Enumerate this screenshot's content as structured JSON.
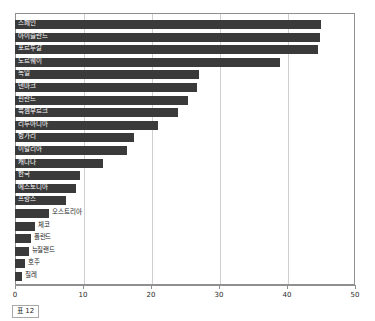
{
  "caption": "표 12",
  "chart_data": {
    "type": "bar",
    "orientation": "horizontal",
    "title": "",
    "xlabel": "",
    "ylabel": "",
    "xlim": [
      0,
      50
    ],
    "xticks": [
      0,
      10,
      20,
      30,
      40,
      50
    ],
    "grid": true,
    "legend": "none",
    "bar_color": "#3a3a3a",
    "categories": [
      "스페인",
      "아이슬란드",
      "포르투갈",
      "노르웨이",
      "독일",
      "덴마크",
      "핀란드",
      "룩셈부르크",
      "리투아니아",
      "헝가리",
      "이탈리아",
      "캐나다",
      "한국",
      "에스토니아",
      "프랑스",
      "오스트리아",
      "체코",
      "폴란드",
      "뉴질랜드",
      "호주",
      "칠레"
    ],
    "values": [
      45.0,
      44.8,
      44.5,
      39.0,
      27.0,
      26.8,
      25.5,
      24.0,
      21.0,
      17.5,
      16.5,
      13.0,
      9.5,
      9.0,
      7.5,
      5.0,
      3.0,
      2.3,
      2.0,
      1.5,
      1.0
    ]
  }
}
